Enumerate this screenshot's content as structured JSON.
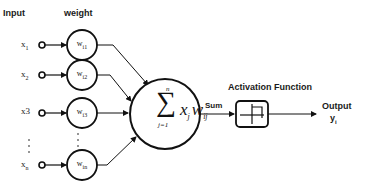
{
  "diagram": {
    "headers": {
      "input": "Input",
      "weight": "weight"
    },
    "inputs": [
      {
        "label": "x",
        "sub": "1",
        "weight": "w",
        "weight_sub": "i1"
      },
      {
        "label": "x",
        "sub": "2",
        "weight": "w",
        "weight_sub": "i2"
      },
      {
        "label": "x",
        "sub": "3",
        "weight": "w",
        "weight_sub": "i3"
      },
      {
        "label": "x",
        "sub": "n",
        "weight": "w",
        "weight_sub": "in"
      }
    ],
    "ellipsis": "⋮",
    "summation": {
      "symbol": "∑",
      "upper": "n",
      "lower": "j=1",
      "term": "x",
      "term_sub": "j",
      "weight": "w",
      "weight_sub": "ij"
    },
    "sum_label": "Sum",
    "activation_label": "Activation Function",
    "activation_icon": "step-function-icon",
    "output_label": "Output",
    "output_var": "y",
    "output_sub": "i",
    "colors": {
      "stroke": "#111111",
      "background": "#ffffff"
    }
  }
}
